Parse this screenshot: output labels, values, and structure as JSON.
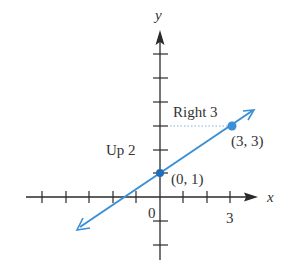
{
  "diagram": {
    "type": "coordinate-plane-line",
    "axes": {
      "x_label": "x",
      "y_label": "y",
      "origin_label": "0",
      "x_tick_label": "3",
      "x_ticks": [
        -5,
        -4,
        -3,
        -2,
        -1,
        1,
        2,
        3
      ],
      "y_ticks": [
        -2,
        -1,
        1,
        2,
        3,
        4,
        5,
        6
      ]
    },
    "line": {
      "slope": "2/3",
      "y_intercept": 1,
      "color": "#3a8fd6"
    },
    "points": [
      {
        "label": "(0, 1)",
        "x": 0,
        "y": 1
      },
      {
        "label": "(3, 3)",
        "x": 3,
        "y": 3
      }
    ],
    "annotations": {
      "rise": "Up 2",
      "run": "Right 3"
    },
    "colors": {
      "axis": "#2a2a2a",
      "line": "#3a8fd6",
      "guide": "#7fb3de",
      "text": "#333333"
    }
  }
}
